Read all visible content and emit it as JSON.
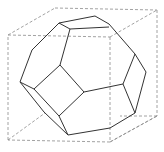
{
  "figure": {
    "colors": {
      "background": "#ffffff",
      "solid_edges": "#333333",
      "cube_edges": "#8a8a8a"
    },
    "cube_edges": [
      [
        8,
        35,
        110,
        37
      ],
      [
        110,
        37,
        110,
        142
      ],
      [
        110,
        142,
        8,
        140
      ],
      [
        8,
        140,
        8,
        35
      ],
      [
        55,
        8,
        157,
        10
      ],
      [
        157,
        10,
        157,
        116
      ],
      [
        157,
        116,
        110,
        142
      ],
      [
        8,
        35,
        55,
        8
      ],
      [
        110,
        37,
        157,
        10
      ],
      [
        8,
        140,
        45,
        113
      ],
      [
        110,
        142,
        157,
        116
      ],
      [
        157,
        116,
        120,
        116
      ]
    ],
    "solid_edges": [
      [
        59,
        23,
        95,
        16
      ],
      [
        95,
        16,
        109,
        24
      ],
      [
        109,
        24,
        135,
        54
      ],
      [
        59,
        23,
        70,
        29
      ],
      [
        70,
        29,
        109,
        27
      ],
      [
        59,
        23,
        32,
        50
      ],
      [
        32,
        50,
        20,
        82
      ],
      [
        70,
        29,
        60,
        65
      ],
      [
        60,
        65,
        34,
        89
      ],
      [
        34,
        89,
        59,
        116
      ],
      [
        59,
        116,
        84,
        92
      ],
      [
        84,
        92,
        60,
        65
      ],
      [
        84,
        92,
        123,
        84
      ],
      [
        123,
        84,
        135,
        54
      ],
      [
        135,
        54,
        146,
        72
      ],
      [
        146,
        72,
        135,
        113
      ],
      [
        123,
        84,
        135,
        113
      ],
      [
        20,
        82,
        34,
        89
      ],
      [
        20,
        82,
        44,
        112
      ],
      [
        44,
        112,
        68,
        135
      ],
      [
        59,
        116,
        68,
        135
      ],
      [
        68,
        135,
        110,
        128
      ],
      [
        110,
        128,
        135,
        113
      ]
    ]
  }
}
